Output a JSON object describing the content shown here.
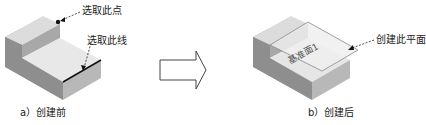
{
  "figure_a": {
    "annotations": {
      "point": "选取此点",
      "line": "选取此线"
    },
    "caption": "a）创建前"
  },
  "figure_b": {
    "annotations": {
      "plane": "创建此平面"
    },
    "plane_label": "基准面1",
    "caption": "b）创建后"
  },
  "arrow": {
    "direction": "right"
  },
  "colors": {
    "top_face": "#e6e6e6",
    "front_face": "#8c8c8c",
    "side_face": "#b4b4b4",
    "edge_line": "#111111",
    "leader": "#222222",
    "plane_fill": "#ececec"
  }
}
